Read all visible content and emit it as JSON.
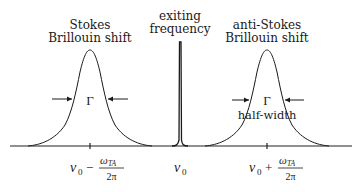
{
  "diagram": {
    "type": "spectrum",
    "peaks": [
      {
        "id": "stokes",
        "label_line1": "Stokes",
        "label_line2": "Brillouin shift",
        "width_symbol": "Γ",
        "position_label": {
          "base": "ν",
          "sub": "0",
          "op": "−",
          "num": "ω",
          "num_sub": "TA",
          "den": "2π"
        }
      },
      {
        "id": "exciting",
        "label_line1": "exiting",
        "label_line2": "frequency",
        "position_label": {
          "base": "ν",
          "sub": "0"
        }
      },
      {
        "id": "anti-stokes",
        "label_line1": "anti-Stokes",
        "label_line2": "Brillouin shift",
        "width_symbol": "Γ",
        "width_caption": "half-width",
        "position_label": {
          "base": "ν",
          "sub": "0",
          "op": "+",
          "num": "ω",
          "num_sub": "TA",
          "den": "2π"
        }
      }
    ]
  }
}
